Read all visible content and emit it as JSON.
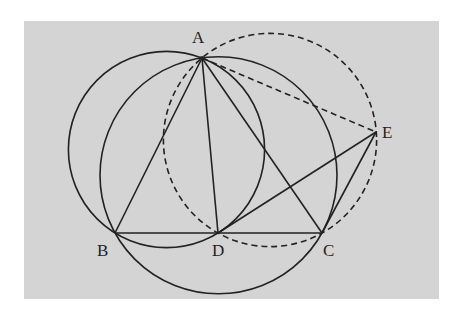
{
  "figure": {
    "background": "#d4d4d4",
    "stroke": "#222222",
    "panel": {
      "x": 24,
      "y": 21,
      "width": 415,
      "height": 278
    }
  },
  "points": {
    "A": {
      "label": "A",
      "x": 202,
      "y": 58
    },
    "B": {
      "label": "B",
      "x": 115,
      "y": 233
    },
    "C": {
      "label": "C",
      "x": 322,
      "y": 233
    },
    "D": {
      "label": "D",
      "x": 218,
      "y": 233
    },
    "E": {
      "label": "E",
      "x": 376,
      "y": 132
    }
  },
  "circles": [
    {
      "name": "circle-ABD",
      "cx": 166.5,
      "cy": 149.5,
      "r": 98.1,
      "style": "solid"
    },
    {
      "name": "circle-ABC",
      "cx": 218.5,
      "cy": 175.3,
      "r": 118.5,
      "style": "solid"
    },
    {
      "name": "circle-ADCE",
      "cx": 270,
      "cy": 140,
      "r": 106.6,
      "style": "dashed"
    }
  ],
  "segments": [
    {
      "name": "AB",
      "style": "solid"
    },
    {
      "name": "AC",
      "style": "solid"
    },
    {
      "name": "AD",
      "style": "solid"
    },
    {
      "name": "BC",
      "style": "solid"
    },
    {
      "name": "DE",
      "style": "solid"
    },
    {
      "name": "CE",
      "style": "solid"
    },
    {
      "name": "AE",
      "style": "dashed"
    }
  ]
}
